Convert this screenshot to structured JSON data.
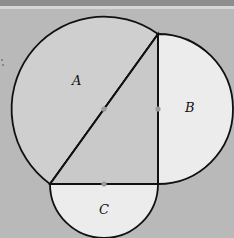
{
  "diagram": {
    "labels": {
      "a": "A",
      "b": "B",
      "c": "C"
    },
    "colors": {
      "background": "#b9b9b9",
      "region_a_fill": "#cfcfcf",
      "region_b_fill": "#ececec",
      "region_c_fill": "#ececec",
      "stroke": "#111111",
      "midpoint_dot": "#9a9a9a"
    }
  }
}
